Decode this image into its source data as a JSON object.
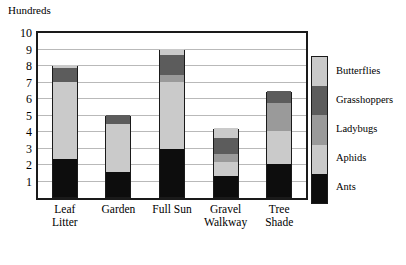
{
  "chart_data": {
    "type": "bar",
    "stacked": true,
    "title": "",
    "unit_caption": "Hundreds",
    "xlabel": "",
    "ylabel": "Hundreds",
    "ylim": [
      0,
      10
    ],
    "ytick_values": [
      1,
      2,
      3,
      4,
      5,
      6,
      7,
      8,
      9,
      10
    ],
    "ytick_labels": [
      "1",
      "2",
      "3",
      "4",
      "5",
      "6",
      "7",
      "8",
      "9",
      "10"
    ],
    "grid": true,
    "grid_axis": "y",
    "legend_position": "right",
    "categories": [
      "Leaf\nLitter",
      "Garden",
      "Full Sun",
      "Gravel\nWalkway",
      "Tree\nShade"
    ],
    "category_labels_flat": [
      "Leaf Litter",
      "Garden",
      "Full Sun",
      "Gravel Walkway",
      "Tree Shade"
    ],
    "series": [
      {
        "name": "Ants",
        "color": "#0d0d0d",
        "values": [
          2.3,
          1.5,
          2.9,
          1.3,
          2.0
        ]
      },
      {
        "name": "Aphids",
        "color": "#cacaca",
        "values": [
          4.7,
          2.9,
          4.1,
          0.8,
          2.0
        ]
      },
      {
        "name": "Ladybugs",
        "color": "#9a9a9a",
        "values": [
          0.0,
          0.0,
          0.4,
          0.5,
          1.7
        ]
      },
      {
        "name": "Grasshoppers",
        "color": "#5c5c5c",
        "values": [
          0.8,
          0.6,
          1.2,
          1.0,
          0.7
        ]
      },
      {
        "name": "Butterflies",
        "color": "#cacaca",
        "values": [
          0.2,
          0.0,
          0.4,
          0.6,
          0.0
        ]
      }
    ],
    "totals": [
      8.0,
      5.0,
      9.0,
      4.2,
      6.4
    ]
  },
  "legend": {
    "entries": [
      {
        "label": "Butterflies",
        "color": "#cacaca"
      },
      {
        "label": "Grasshoppers",
        "color": "#5c5c5c"
      },
      {
        "label": "Ladybugs",
        "color": "#9a9a9a"
      },
      {
        "label": "Aphids",
        "color": "#cacaca"
      },
      {
        "label": "Ants",
        "color": "#0d0d0d"
      }
    ]
  },
  "colors": {
    "axis": "#1a1a1a",
    "gridline": "#b9b9b9",
    "background": "#ffffff",
    "text": "#000000"
  }
}
